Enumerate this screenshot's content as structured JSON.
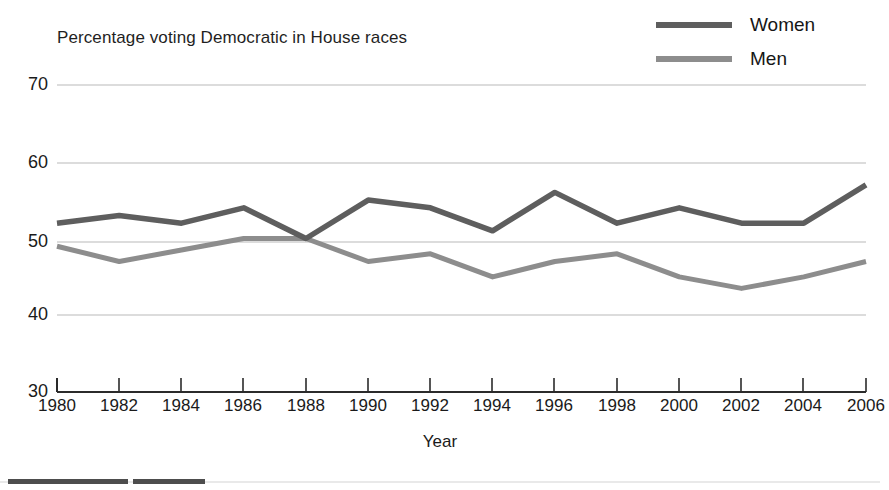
{
  "chart_data": {
    "type": "line",
    "title": "Percentage voting Democratic in House races",
    "xlabel": "Year",
    "ylabel": "",
    "categories": [
      1980,
      1982,
      1984,
      1986,
      1988,
      1990,
      1992,
      1994,
      1996,
      1998,
      2000,
      2002,
      2004,
      2006
    ],
    "xtick_labels": [
      "1980",
      "1982",
      "1984",
      "1986",
      "1988",
      "1990",
      "1992",
      "1994",
      "1996",
      "1998",
      "2000",
      "2002",
      "2004",
      "2006"
    ],
    "ytick_labels": [
      "30",
      "40",
      "50",
      "60",
      "70"
    ],
    "yticks": [
      30,
      40,
      50,
      60,
      70
    ],
    "xlim": [
      1980,
      2006
    ],
    "ylim": [
      30,
      70
    ],
    "grid": "horizontal",
    "legend_position": "top-right",
    "series": [
      {
        "name": "Women",
        "color": "#5e5e5e",
        "values": [
          52,
          53,
          52,
          54,
          50,
          55,
          54,
          51,
          56,
          52,
          54,
          52,
          52,
          57
        ]
      },
      {
        "name": "Men",
        "color": "#8d8d8d",
        "values": [
          49,
          47,
          48.5,
          50,
          50,
          47,
          48,
          45,
          47,
          48,
          45,
          43.5,
          45,
          47
        ]
      }
    ]
  },
  "legend": {
    "items": [
      {
        "label": "Women",
        "color": "#5e5e5e"
      },
      {
        "label": "Men",
        "color": "#8d8d8d"
      }
    ]
  },
  "axes": {
    "x_axis_name": "Year",
    "y_tick_30": "30",
    "y_tick_40": "40",
    "y_tick_50": "50",
    "y_tick_60": "60",
    "y_tick_70": "70"
  },
  "colors": {
    "women_line": "#5e5e5e",
    "men_line": "#8d8d8d",
    "gridline": "#b9b9b9",
    "axis": "#2b2b2b",
    "background": "#ffffff"
  }
}
